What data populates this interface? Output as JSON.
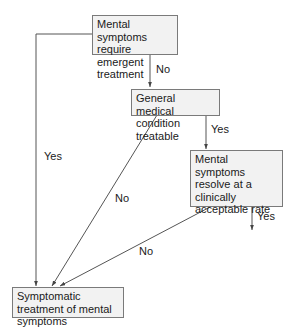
{
  "diagram": {
    "type": "flowchart",
    "colors": {
      "node_fill": "#f2f2f2",
      "node_border": "#7a7a7a",
      "line": "#555555",
      "text": "#1a1a1a"
    },
    "nodes": [
      {
        "id": "n1",
        "text": "Mental symptoms require emergent treatment"
      },
      {
        "id": "n2",
        "text": "General medical condition treatable"
      },
      {
        "id": "n3",
        "text": "Mental symptoms resolve at a clinically acceptable rate"
      },
      {
        "id": "n4",
        "text": "Symptomatic treatment of mental symptoms"
      }
    ],
    "edges": [
      {
        "from": "n1",
        "to": "n2",
        "label": "No"
      },
      {
        "from": "n1",
        "to": "n4",
        "label": "Yes"
      },
      {
        "from": "n2",
        "to": "n3",
        "label": "Yes"
      },
      {
        "from": "n2",
        "to": "n4",
        "label": "No"
      },
      {
        "from": "n3",
        "to": "n4",
        "label": "No"
      },
      {
        "from": "n3",
        "to": null,
        "label": "Yes"
      }
    ]
  }
}
